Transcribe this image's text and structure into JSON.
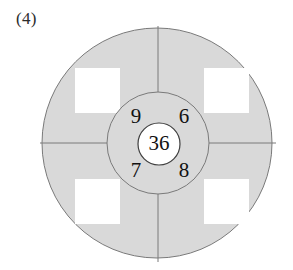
{
  "figure": {
    "label": "(4)",
    "type": "concentric-circle-number-puzzle"
  },
  "colors": {
    "background": "#ffffff",
    "ring_fill": "#d9d9d9",
    "square_fill": "#ffffff",
    "stroke": "#7a7a7a",
    "inner_circle_fill": "#ffffff",
    "text": "#121212"
  },
  "center": {
    "value": "36"
  },
  "quadrants": [
    {
      "position": "top-left",
      "value": "9"
    },
    {
      "position": "top-right",
      "value": "6"
    },
    {
      "position": "bottom-left",
      "value": "7"
    },
    {
      "position": "bottom-right",
      "value": "8"
    }
  ],
  "outer_squares": [
    {
      "position": "top-left",
      "value": ""
    },
    {
      "position": "top-right",
      "value": ""
    },
    {
      "position": "bottom-left",
      "value": ""
    },
    {
      "position": "bottom-right",
      "value": ""
    }
  ],
  "geometry": {
    "outer_circle": {
      "cx": 157,
      "cy": 143,
      "r": 115
    },
    "middle_circle": {
      "cx": 158,
      "cy": 143,
      "r": 51
    },
    "inner_circle": {
      "cx": 159,
      "cy": 144,
      "r": 21
    },
    "square_size": 45,
    "squares": [
      {
        "x": 75,
        "y": 68
      },
      {
        "x": 204,
        "y": 68
      },
      {
        "x": 75,
        "y": 179
      },
      {
        "x": 204,
        "y": 179
      }
    ],
    "quadrant_label_points": [
      {
        "x": 136,
        "y": 117
      },
      {
        "x": 183,
        "y": 117
      },
      {
        "x": 136,
        "y": 171
      },
      {
        "x": 183,
        "y": 171
      }
    ]
  }
}
